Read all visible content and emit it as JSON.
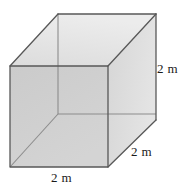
{
  "figure": {
    "name": "cube-diagram",
    "shape": "cube",
    "background_color": "#ffffff",
    "edge_color": "#5a5a5a",
    "hidden_edge_color": "#8a8a8a",
    "faces": {
      "top": {
        "name": "top-face",
        "fill": "#e9e9e9"
      },
      "right": {
        "name": "right-face",
        "fill": "#dedede"
      },
      "front": {
        "name": "front-face",
        "fill": "#cfcfcf"
      },
      "left_wing": {
        "name": "left-face",
        "fill": "#d6d6d6"
      }
    },
    "geometry": {
      "front_top_left": [
        10,
        66
      ],
      "front_top_right": [
        108,
        66
      ],
      "front_bottom_right": [
        108,
        167
      ],
      "front_bottom_left": [
        10,
        167
      ],
      "back_top_left": [
        58,
        14
      ],
      "back_top_right": [
        156,
        14
      ],
      "back_bottom_right": [
        156,
        120
      ],
      "back_bottom_left": [
        58,
        114
      ]
    }
  },
  "labels": {
    "height": "2 m",
    "depth": "2 m",
    "width": "2 m"
  }
}
